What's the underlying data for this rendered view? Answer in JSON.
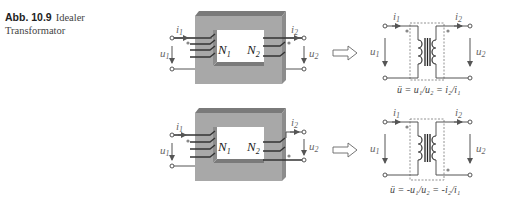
{
  "caption": {
    "number": "Abb. 10.9",
    "text": "Idealer Transformator"
  },
  "diagrams": [
    {
      "id": "same-winding",
      "core_labels": {
        "n1": "N",
        "n1_sub": "1",
        "n2": "N",
        "n2_sub": "2"
      },
      "currents": {
        "i1": "i",
        "i1_sub": "1",
        "i2": "i",
        "i2_sub": "2"
      },
      "voltages": {
        "u1": "u",
        "u1_sub": "1",
        "u2": "u",
        "u2_sub": "2"
      },
      "equation": "ü = u₁/u₂ = i₂/i₁"
    },
    {
      "id": "opposite-winding",
      "core_labels": {
        "n1": "N",
        "n1_sub": "1",
        "n2": "N",
        "n2_sub": "2"
      },
      "currents": {
        "i1": "i",
        "i1_sub": "1",
        "i2": "i",
        "i2_sub": "2"
      },
      "voltages": {
        "u1": "u",
        "u1_sub": "1",
        "u2": "u",
        "u2_sub": "2"
      },
      "equation": "ü = -u₁/u₂ = -i₂/i₁"
    }
  ],
  "colors": {
    "core_face": "#a8a8a8",
    "core_top": "#7a7a7a",
    "core_side": "#8c8c8c",
    "wire": "#555555",
    "text": "#444444"
  }
}
